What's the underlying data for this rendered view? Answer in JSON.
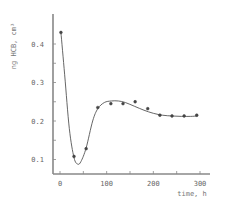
{
  "chart_data": {
    "type": "line",
    "title": "",
    "xlabel": "time, h",
    "ylabel": "ng HCB, cm³",
    "xlim": [
      -15,
      320
    ],
    "ylim": [
      0.065,
      0.47
    ],
    "x_ticks": [
      0,
      100,
      200,
      300
    ],
    "x_tick_labels": [
      "0",
      "100",
      "200",
      "300"
    ],
    "x_minor_ticks": [
      50,
      150,
      250
    ],
    "y_ticks": [
      0.1,
      0.2,
      0.3,
      0.4
    ],
    "y_tick_labels": [
      "0.1",
      "0.2",
      "0.3",
      "0.4"
    ],
    "y_minor_ticks": [
      0.15,
      0.25,
      0.35
    ],
    "grid": false,
    "legend": null,
    "series": [
      {
        "name": "measured",
        "kind": "scatter",
        "marker": "circle",
        "x": [
          2,
          30,
          56,
          81,
          109,
          135,
          161,
          188,
          214,
          240,
          266,
          293
        ],
        "y": [
          0.43,
          0.108,
          0.128,
          0.235,
          0.245,
          0.245,
          0.25,
          0.232,
          0.215,
          0.213,
          0.213,
          0.215
        ]
      },
      {
        "name": "fitted curve",
        "kind": "line",
        "x": [
          2,
          10,
          20,
          30,
          38,
          45,
          56,
          70,
          81,
          95,
          110,
          125,
          140,
          160,
          180,
          200,
          220,
          240,
          260,
          280,
          295
        ],
        "y": [
          0.43,
          0.32,
          0.18,
          0.105,
          0.088,
          0.095,
          0.13,
          0.2,
          0.232,
          0.248,
          0.252,
          0.252,
          0.248,
          0.238,
          0.228,
          0.22,
          0.215,
          0.213,
          0.212,
          0.212,
          0.213
        ]
      }
    ]
  },
  "labels": {
    "x_axis_title": "time, h",
    "y_axis_title": "ng HCB, cm³"
  }
}
